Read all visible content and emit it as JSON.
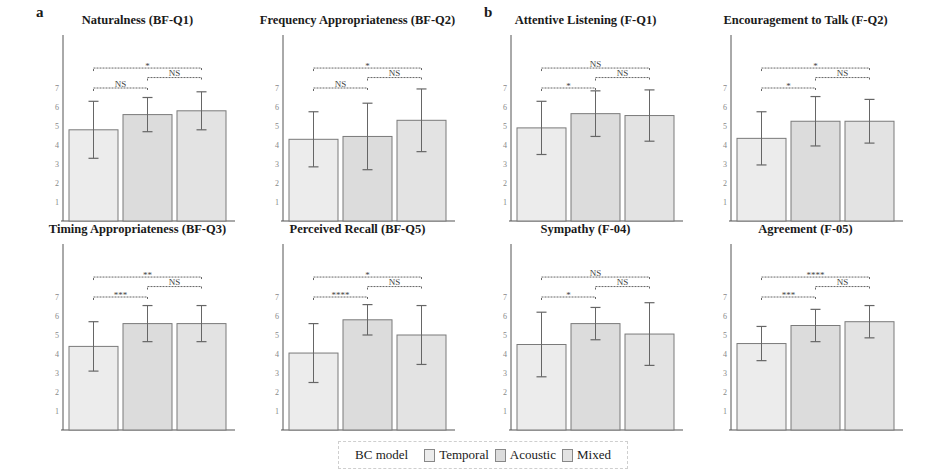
{
  "panel_labels": {
    "a": "a",
    "b": "b"
  },
  "legend": {
    "title": "BC model",
    "items": [
      {
        "label": "Temporal",
        "color": "#ececec"
      },
      {
        "label": "Acoustic",
        "color": "#dcdcdc"
      },
      {
        "label": "Mixed",
        "color": "#e3e3e3"
      }
    ]
  },
  "colors": {
    "bar_stroke": "#7a7a7a",
    "axis": "#555555",
    "error": "#666666",
    "bracket": "#666666"
  },
  "chart_data": [
    {
      "type": "bar",
      "title": "Naturalness (BF-Q1)",
      "categories": [
        "Temporal",
        "Acoustic",
        "Mixed"
      ],
      "values": [
        4.8,
        5.6,
        5.8
      ],
      "errors": [
        1.5,
        0.9,
        1.0
      ],
      "yticks": [
        1,
        2,
        3,
        4,
        5,
        6,
        7
      ],
      "ylim": [
        0,
        8.5
      ],
      "significance": [
        {
          "from": 0,
          "to": 1,
          "label": "NS"
        },
        {
          "from": 1,
          "to": 2,
          "label": "NS"
        },
        {
          "from": 0,
          "to": 2,
          "label": "*"
        }
      ]
    },
    {
      "type": "bar",
      "title": "Frequency Appropriateness (BF-Q2)",
      "categories": [
        "Temporal",
        "Acoustic",
        "Mixed"
      ],
      "values": [
        4.3,
        4.45,
        5.3
      ],
      "errors": [
        1.45,
        1.75,
        1.65
      ],
      "yticks": [
        1,
        2,
        3,
        4,
        5,
        6,
        7
      ],
      "ylim": [
        0,
        8.5
      ],
      "significance": [
        {
          "from": 0,
          "to": 1,
          "label": "NS"
        },
        {
          "from": 1,
          "to": 2,
          "label": "NS"
        },
        {
          "from": 0,
          "to": 2,
          "label": "*"
        }
      ]
    },
    {
      "type": "bar",
      "title": "Attentive Listening (F-Q1)",
      "categories": [
        "Temporal",
        "Acoustic",
        "Mixed"
      ],
      "values": [
        4.9,
        5.65,
        5.55
      ],
      "errors": [
        1.4,
        1.2,
        1.35
      ],
      "yticks": [
        1,
        2,
        3,
        4,
        5,
        6,
        7
      ],
      "ylim": [
        0,
        8.5
      ],
      "significance": [
        {
          "from": 0,
          "to": 1,
          "label": "*"
        },
        {
          "from": 1,
          "to": 2,
          "label": "NS"
        },
        {
          "from": 0,
          "to": 2,
          "label": "NS"
        }
      ]
    },
    {
      "type": "bar",
      "title": "Encouragement to Talk (F-Q2)",
      "categories": [
        "Temporal",
        "Acoustic",
        "Mixed"
      ],
      "values": [
        4.35,
        5.25,
        5.25
      ],
      "errors": [
        1.4,
        1.3,
        1.15
      ],
      "yticks": [
        1,
        2,
        3,
        4,
        5,
        6,
        7
      ],
      "ylim": [
        0,
        8.5
      ],
      "significance": [
        {
          "from": 0,
          "to": 1,
          "label": "*"
        },
        {
          "from": 1,
          "to": 2,
          "label": "NS"
        },
        {
          "from": 0,
          "to": 2,
          "label": "*"
        }
      ]
    },
    {
      "type": "bar",
      "title": "Timing Appropriateness (BF-Q3)",
      "categories": [
        "Temporal",
        "Acoustic",
        "Mixed"
      ],
      "values": [
        4.4,
        5.6,
        5.6
      ],
      "errors": [
        1.3,
        0.95,
        0.95
      ],
      "yticks": [
        1,
        2,
        3,
        4,
        5,
        6,
        7
      ],
      "ylim": [
        0,
        8.5
      ],
      "significance": [
        {
          "from": 0,
          "to": 1,
          "label": "***"
        },
        {
          "from": 1,
          "to": 2,
          "label": "NS"
        },
        {
          "from": 0,
          "to": 2,
          "label": "**"
        }
      ]
    },
    {
      "type": "bar",
      "title": "Perceived Recall (BF-Q5)",
      "categories": [
        "Temporal",
        "Acoustic",
        "Mixed"
      ],
      "values": [
        4.05,
        5.8,
        5.0
      ],
      "errors": [
        1.55,
        0.8,
        1.55
      ],
      "yticks": [
        1,
        2,
        3,
        4,
        5,
        6,
        7
      ],
      "ylim": [
        0,
        8.5
      ],
      "significance": [
        {
          "from": 0,
          "to": 1,
          "label": "****"
        },
        {
          "from": 1,
          "to": 2,
          "label": "NS"
        },
        {
          "from": 0,
          "to": 2,
          "label": "*"
        }
      ]
    },
    {
      "type": "bar",
      "title": "Sympathy (F-04)",
      "categories": [
        "Temporal",
        "Acoustic",
        "Mixed"
      ],
      "values": [
        4.5,
        5.6,
        5.05
      ],
      "errors": [
        1.7,
        0.85,
        1.65
      ],
      "yticks": [
        1,
        2,
        3,
        4,
        5,
        6,
        7
      ],
      "ylim": [
        0,
        8.5
      ],
      "significance": [
        {
          "from": 0,
          "to": 1,
          "label": "*"
        },
        {
          "from": 1,
          "to": 2,
          "label": "NS"
        },
        {
          "from": 0,
          "to": 2,
          "label": "NS"
        }
      ]
    },
    {
      "type": "bar",
      "title": "Agreement (F-05)",
      "categories": [
        "Temporal",
        "Acoustic",
        "Mixed"
      ],
      "values": [
        4.55,
        5.5,
        5.7
      ],
      "errors": [
        0.9,
        0.85,
        0.85
      ],
      "yticks": [
        1,
        2,
        3,
        4,
        5,
        6,
        7
      ],
      "ylim": [
        0,
        8.5
      ],
      "significance": [
        {
          "from": 0,
          "to": 1,
          "label": "***"
        },
        {
          "from": 1,
          "to": 2,
          "label": "NS"
        },
        {
          "from": 0,
          "to": 2,
          "label": "****"
        }
      ]
    }
  ]
}
